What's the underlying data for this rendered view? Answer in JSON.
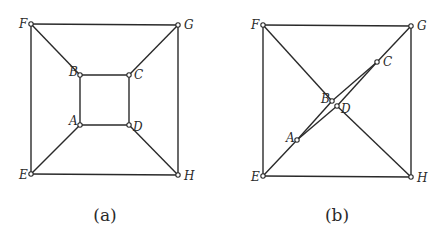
{
  "figure": {
    "edges": [
      [
        "F",
        "G"
      ],
      [
        "G",
        "H"
      ],
      [
        "H",
        "E"
      ],
      [
        "E",
        "F"
      ],
      [
        "A",
        "B"
      ],
      [
        "B",
        "C"
      ],
      [
        "C",
        "D"
      ],
      [
        "D",
        "A"
      ],
      [
        "A",
        "E"
      ],
      [
        "B",
        "F"
      ],
      [
        "C",
        "G"
      ],
      [
        "D",
        "H"
      ]
    ],
    "panels": [
      {
        "id": "a",
        "caption": "(a)",
        "vertices": [
          "A",
          "B",
          "C",
          "D",
          "E",
          "F",
          "G",
          "H"
        ]
      },
      {
        "id": "b",
        "caption": "(b)",
        "vertices": [
          "A",
          "B",
          "C",
          "D",
          "E",
          "F",
          "G",
          "H"
        ]
      }
    ]
  }
}
